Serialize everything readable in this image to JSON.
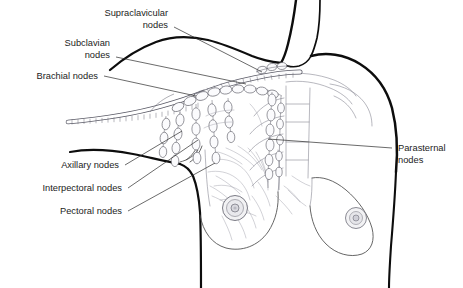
{
  "figure": {
    "background_color": "#ffffff",
    "line_color": "#0d0d0d",
    "label_color": "#1c1c1c",
    "node_fill_color": "#fbfbfd",
    "width": 463,
    "height": 288
  },
  "labels": [
    {
      "id": "supraclavicular",
      "lines": [
        "Supraclavicular",
        "nodes"
      ],
      "line1": "Supraclavicular",
      "line2": "nodes",
      "align": "right",
      "text_x": 168,
      "text_y": 16,
      "leader_from": [
        174,
        27
      ],
      "leader_to": [
        262,
        72
      ]
    },
    {
      "id": "subclavian",
      "lines": [
        "Subclavian",
        "nodes"
      ],
      "line1": "Subclavian",
      "line2": "nodes",
      "align": "right",
      "text_x": 110,
      "text_y": 46,
      "leader_from": [
        116,
        57
      ],
      "leader_to": [
        246,
        84
      ]
    },
    {
      "id": "brachial",
      "lines": [
        "Brachial nodes"
      ],
      "line1": "Brachial nodes",
      "line2": "",
      "align": "right",
      "text_x": 98,
      "text_y": 79,
      "leader_from": [
        104,
        76
      ],
      "leader_to": [
        196,
        96
      ]
    },
    {
      "id": "axillary",
      "lines": [
        "Axillary nodes"
      ],
      "line1": "Axillary nodes",
      "line2": "",
      "align": "right",
      "text_x": 119,
      "text_y": 168,
      "leader_from": [
        125,
        165
      ],
      "leader_to": [
        182,
        131
      ]
    },
    {
      "id": "interpectoral",
      "lines": [
        "Interpectoral nodes"
      ],
      "line1": "Interpectoral nodes",
      "line2": "",
      "align": "right",
      "text_x": 122,
      "text_y": 191,
      "leader_from": [
        128,
        188
      ],
      "leader_to": [
        198,
        140
      ]
    },
    {
      "id": "pectoral",
      "lines": [
        "Pectoral nodes"
      ],
      "line1": "Pectoral nodes",
      "line2": "",
      "align": "right",
      "text_x": 122,
      "text_y": 214,
      "leader_from": [
        128,
        211
      ],
      "leader_to": [
        215,
        163
      ]
    },
    {
      "id": "parasternal",
      "lines": [
        "Parasternal",
        "nodes"
      ],
      "line1": "Parasternal",
      "line2": "nodes",
      "align": "left",
      "text_x": 398,
      "text_y": 151,
      "leader_from": [
        392,
        148
      ],
      "leader_to": [
        268,
        139
      ]
    }
  ],
  "anatomy": {
    "regions": [
      "neck",
      "left shoulder and upper arm",
      "right shoulder",
      "clavicle",
      "sternum",
      "ribs",
      "left breast (dissected)",
      "right breast (intact)",
      "thoracic duct"
    ],
    "node_groups": [
      "supraclavicular",
      "subclavian",
      "brachial",
      "axillary",
      "interpectoral",
      "pectoral",
      "parasternal"
    ]
  }
}
